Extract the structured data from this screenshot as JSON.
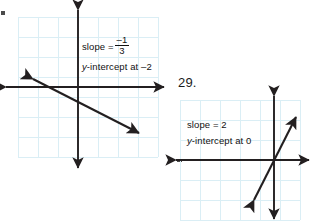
{
  "page": {
    "background": "#ffffff",
    "grid_color": "#daeef5",
    "axis_color": "#231f20",
    "line_color": "#231f20",
    "text_color": "#111111"
  },
  "problems": [
    {
      "id": "problem-left",
      "number": "",
      "annotation": {
        "slope_label": "slope = ",
        "slope_fraction": {
          "numerator": "–1",
          "denominator": "3"
        },
        "slope_plain": "–1/3",
        "intercept_prefix": "y",
        "intercept_text": "-intercept at –2"
      },
      "graph": {
        "grid_cols": 7,
        "grid_rows": 7,
        "cell_px": 20,
        "origin_x": 0,
        "origin_y": 0,
        "line": {
          "slope": "-1/3",
          "y_intercept": -2,
          "description": "line falling left to right through origin region with arrowheads at both ends"
        }
      }
    },
    {
      "id": "problem-right",
      "number": "29.",
      "annotation": {
        "slope_label": "slope = 2",
        "intercept_prefix": "y",
        "intercept_text": "-intercept at 0"
      },
      "graph": {
        "grid_cols": 6,
        "grid_rows": 6,
        "cell_px": 20,
        "origin_x": 0,
        "origin_y": 0,
        "line": {
          "slope": "2",
          "y_intercept": 0,
          "description": "steep line rising left to right through the origin with arrowheads at both ends"
        }
      }
    }
  ],
  "icons": {
    "axis_arrow": "arrowhead",
    "line_arrow": "arrowhead"
  }
}
